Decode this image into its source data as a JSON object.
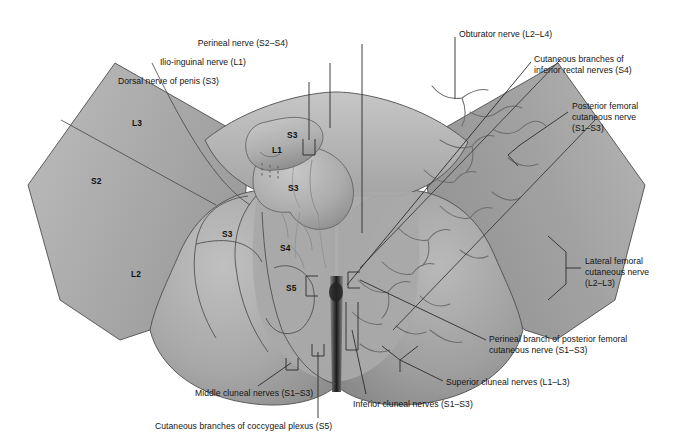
{
  "figure": {
    "view": "posterior / lithotomy view"
  },
  "colors": {
    "background": "#ffffff",
    "skin_light": "#c2c2c2",
    "skin_mid": "#a6a6a6",
    "skin_dark": "#8d8d8d",
    "skin_darker": "#777777",
    "outline": "#4a4a4a",
    "nerve": "#6e6e6e",
    "leader": "#2b2b2b",
    "text": "#141414"
  },
  "labels": [
    {
      "id": "dorsal-nerve-of-penis",
      "text": "Dorsal nerve of penis (S3)",
      "x": 219,
      "y": 76,
      "align": "right"
    },
    {
      "id": "ilio-inguinal-nerve",
      "text": "Ilio-inguinal nerve (L1)",
      "x": 246,
      "y": 57,
      "align": "right"
    },
    {
      "id": "perineal-nerve",
      "text": "Perineal nerve (S2–S4)",
      "x": 288,
      "y": 38,
      "align": "right"
    },
    {
      "id": "obturator-nerve",
      "text": "Obturator nerve (L2–L4)",
      "x": 459,
      "y": 29,
      "align": "left"
    },
    {
      "id": "cutaneous-branches-inferior-rectal",
      "text": "Cutaneous branches of\ninferior rectal nerves (S4)",
      "x": 534,
      "y": 54,
      "align": "left"
    },
    {
      "id": "posterior-femoral-cutaneous-nerve",
      "text": "Posterior femoral\ncutaneous nerve\n(S1–S3)",
      "x": 572,
      "y": 101,
      "align": "left"
    },
    {
      "id": "lateral-femoral-cutaneous-nerve",
      "text": "Lateral femoral\ncutaneous nerve\n(L2–L3)",
      "x": 585,
      "y": 256,
      "align": "left"
    },
    {
      "id": "perineal-branch-posterior-femoral",
      "text": "Perineal branch of posterior femoral\ncutaneous nerve (S1–S3)",
      "x": 489,
      "y": 334,
      "align": "left"
    },
    {
      "id": "superior-cluneal-nerves",
      "text": "Superior cluneal nerves (L1–L3)",
      "x": 446,
      "y": 377,
      "align": "left"
    },
    {
      "id": "inferior-cluneal-nerves",
      "text": "Inferior cluneal nerves (S1–S3)",
      "x": 353,
      "y": 399,
      "align": "left"
    },
    {
      "id": "middle-cluneal-nerves",
      "text": "Middle cluneal nerves (S1–S3)",
      "x": 195,
      "y": 388,
      "align": "left"
    },
    {
      "id": "cutaneous-branches-coccygeal-plexus",
      "text": "Cutaneous branches of coccygeal plexus (S5)",
      "x": 155,
      "y": 421,
      "align": "left"
    }
  ],
  "dermatomes": [
    {
      "id": "l3-left",
      "text": "L3",
      "x": 132,
      "y": 118
    },
    {
      "id": "s2-left",
      "text": "S2",
      "x": 91,
      "y": 176
    },
    {
      "id": "l2-left",
      "text": "L2",
      "x": 131,
      "y": 269
    },
    {
      "id": "s3-left",
      "text": "S3",
      "x": 222,
      "y": 229
    },
    {
      "id": "s3-upper",
      "text": "S3",
      "x": 287,
      "y": 130
    },
    {
      "id": "l1-penis",
      "text": "L1",
      "x": 272,
      "y": 145
    },
    {
      "id": "s3-lower",
      "text": "S3",
      "x": 288,
      "y": 183
    },
    {
      "id": "s4",
      "text": "S4",
      "x": 280,
      "y": 243
    },
    {
      "id": "s5",
      "text": "S5",
      "x": 286,
      "y": 283
    }
  ]
}
